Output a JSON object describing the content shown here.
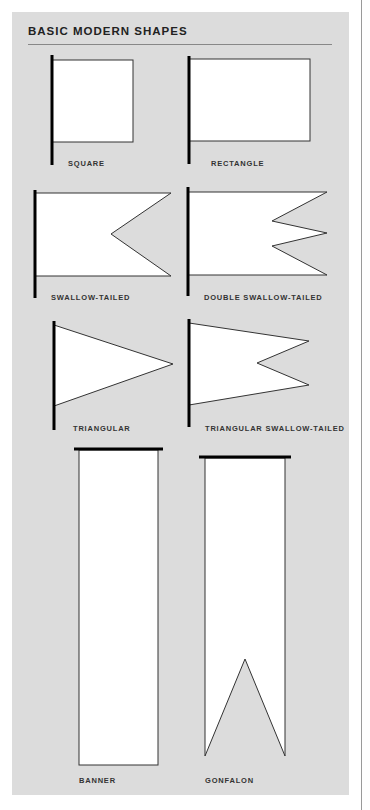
{
  "header": {
    "title": "BASIC MODERN SHAPES"
  },
  "colors": {
    "panel": "#dcdcdc",
    "flag_fill": "#ffffff",
    "outline": "#111111"
  },
  "shapes": [
    {
      "id": "square",
      "label": "SQUARE"
    },
    {
      "id": "rectangle",
      "label": "RECTANGLE"
    },
    {
      "id": "swallow-tailed",
      "label": "SWALLOW-TAILED"
    },
    {
      "id": "double-swallow-tailed",
      "label": "DOUBLE SWALLOW-TAILED"
    },
    {
      "id": "triangular",
      "label": "TRIANGULAR"
    },
    {
      "id": "triangular-swallow-tailed",
      "label": "TRIANGULAR SWALLOW-TAILED"
    },
    {
      "id": "banner",
      "label": "BANNER"
    },
    {
      "id": "gonfalon",
      "label": "GONFALON"
    }
  ]
}
